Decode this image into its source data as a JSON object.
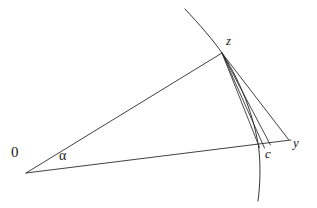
{
  "figure": {
    "kind": "geometric-diagram",
    "background_color": "#ffffff",
    "stroke_color": "#2b2b2b",
    "labels": {
      "origin": "0",
      "angle": "α",
      "apex": "z",
      "right_vertex": "y",
      "curve_intersection": "c"
    },
    "points": {
      "origin": {
        "x": 26,
        "y": 173
      },
      "apex_z": {
        "x": 222,
        "y": 53
      },
      "vertex_y": {
        "x": 288,
        "y": 139
      },
      "point_c": {
        "x": 259,
        "y": 147
      }
    },
    "geodesic_curve": {
      "name": "geodesic-arc",
      "start": {
        "x": 185,
        "y": 9
      },
      "through": {
        "x": 222,
        "y": 53
      },
      "end": {
        "x": 258,
        "y": 201
      }
    },
    "fan_lines_from_z": [
      {
        "name": "z-to-y-side",
        "end_x": 288,
        "end_y": 139
      },
      {
        "name": "z-to-near-c-outer",
        "end_x": 270,
        "end_y": 145
      },
      {
        "name": "z-to-near-c-middle",
        "end_x": 264,
        "end_y": 148
      },
      {
        "name": "z-to-c",
        "end_x": 259.5,
        "end_y": 147.5
      }
    ],
    "rays_from_origin": [
      {
        "name": "ray-0-to-z",
        "end_x": 222,
        "end_y": 53
      },
      {
        "name": "ray-0-to-y",
        "end_x": 290,
        "end_y": 140
      }
    ]
  }
}
